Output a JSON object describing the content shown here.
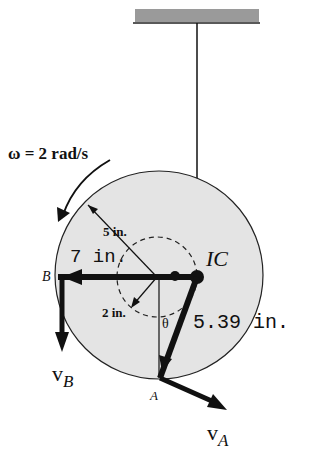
{
  "diagram": {
    "omega_label": "ω = 2 rad/s",
    "labels": {
      "outer_radius": "5 in.",
      "inner_radius": "2 in.",
      "dist_B": "7 in.",
      "dist_A": "5.39 in.",
      "ic": "IC",
      "point_B": "B",
      "point_A": "A",
      "theta": "θ",
      "vB_main": "v",
      "vB_sub": "B",
      "vA_main": "v",
      "vA_sub": "A"
    },
    "colors": {
      "disk_fill": "#e4e4e4",
      "ink": "#111111",
      "ceiling": "#9a9a9a"
    }
  }
}
